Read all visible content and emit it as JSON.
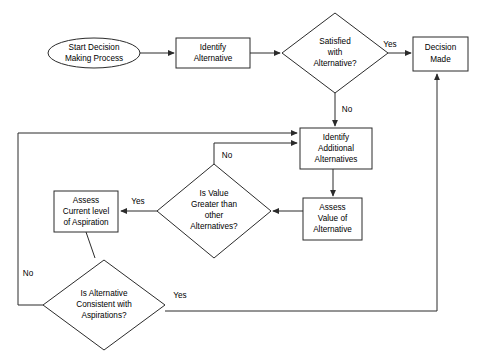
{
  "diagram": {
    "type": "flowchart",
    "background_color": "#ffffff",
    "line_color": "#2b2b2b",
    "text_color": "#000000",
    "nodes": [
      {
        "id": "start",
        "shape": "ellipse",
        "lines": [
          "Start Decision",
          "Making Process"
        ],
        "line1": "Start Decision",
        "line2": "Making Process",
        "cx": 94,
        "cy": 53,
        "rx": 46,
        "ry": 15
      },
      {
        "id": "identify-alternative",
        "shape": "rectangle",
        "lines": [
          "Identify",
          "Alternative"
        ],
        "line1": "Identify",
        "line2": "Alternative",
        "x": 176,
        "y": 38,
        "w": 74,
        "h": 30
      },
      {
        "id": "satisfied-with-alternative",
        "shape": "diamond",
        "lines": [
          "Satisfied",
          "with",
          "Alternative?"
        ],
        "line1": "Satisfied",
        "line2": "with",
        "line3": "Alternative?",
        "cx": 335,
        "cy": 53,
        "rx": 53,
        "ry": 40
      },
      {
        "id": "decision-made",
        "shape": "rectangle",
        "lines": [
          "Decision",
          "Made"
        ],
        "line1": "Decision",
        "line2": "Made",
        "x": 413,
        "y": 37,
        "w": 55,
        "h": 34
      },
      {
        "id": "identify-additional-alternatives",
        "shape": "rectangle",
        "lines": [
          "Identify",
          "Additional",
          "Alternatives"
        ],
        "line1": "Identify",
        "line2": "Additional",
        "line3": "Alternatives",
        "x": 300,
        "y": 128,
        "w": 72,
        "h": 41
      },
      {
        "id": "assess-value-of-alternative",
        "shape": "rectangle",
        "lines": [
          "Assess",
          "Value of",
          "Alternative"
        ],
        "line1": "Assess",
        "line2": "Value of",
        "line3": "Alternative",
        "x": 303,
        "y": 198,
        "w": 59,
        "h": 42
      },
      {
        "id": "is-value-greater",
        "shape": "diamond",
        "lines": [
          "Is Value",
          "Greater than",
          "other",
          "Alternatives?"
        ],
        "line1": "Is Value",
        "line2": "Greater than",
        "line3": "other",
        "line4": "Alternatives?",
        "cx": 214,
        "cy": 211,
        "rx": 57,
        "ry": 47
      },
      {
        "id": "assess-current-level-of-aspiration",
        "shape": "rectangle",
        "lines": [
          "Assess",
          "Current level",
          "of Aspiration"
        ],
        "line1": "Assess",
        "line2": "Current level",
        "line3": "of Aspiration",
        "x": 54,
        "y": 191,
        "w": 64,
        "h": 41
      },
      {
        "id": "is-alternative-consistent",
        "shape": "diamond",
        "lines": [
          "Is Alternative",
          "Consistent with",
          "Aspirations?"
        ],
        "line1": "Is Alternative",
        "line2": "Consistent with",
        "line3": "Aspirations?",
        "cx": 104,
        "cy": 305,
        "rx": 61,
        "ry": 45
      }
    ],
    "edge_labels": [
      {
        "id": "yes-satisfied",
        "text": "Yes",
        "x": 390,
        "y": 45
      },
      {
        "id": "no-satisfied",
        "text": "No",
        "x": 347,
        "y": 110
      },
      {
        "id": "no-is-value-greater",
        "text": "No",
        "x": 227,
        "y": 156
      },
      {
        "id": "yes-is-value-greater",
        "text": "Yes",
        "x": 138,
        "y": 202
      },
      {
        "id": "no-is-alternative-consistent",
        "text": "No",
        "x": 28,
        "y": 274
      },
      {
        "id": "yes-is-alternative-consistent",
        "text": "Yes",
        "x": 180,
        "y": 296
      }
    ],
    "edges": [
      {
        "id": "start-to-identify",
        "from": "start",
        "to": "identify-alternative",
        "label": ""
      },
      {
        "id": "identify-to-satisfied",
        "from": "identify-alternative",
        "to": "satisfied-with-alternative",
        "label": ""
      },
      {
        "id": "satisfied-yes-to-decision",
        "from": "satisfied-with-alternative",
        "to": "decision-made",
        "label": "Yes"
      },
      {
        "id": "satisfied-no-to-additional",
        "from": "satisfied-with-alternative",
        "to": "identify-additional-alternatives",
        "label": "No"
      },
      {
        "id": "additional-to-assess-value",
        "from": "identify-additional-alternatives",
        "to": "assess-value-of-alternative",
        "label": ""
      },
      {
        "id": "assess-value-to-is-value-greater",
        "from": "assess-value-of-alternative",
        "to": "is-value-greater",
        "label": ""
      },
      {
        "id": "is-value-greater-no-to-additional",
        "from": "is-value-greater",
        "to": "identify-additional-alternatives",
        "label": "No"
      },
      {
        "id": "is-value-greater-yes-to-aspiration",
        "from": "is-value-greater",
        "to": "assess-current-level-of-aspiration",
        "label": "Yes"
      },
      {
        "id": "aspiration-to-is-consistent",
        "from": "assess-current-level-of-aspiration",
        "to": "is-alternative-consistent",
        "label": ""
      },
      {
        "id": "is-consistent-no-to-additional",
        "from": "is-alternative-consistent",
        "to": "identify-additional-alternatives",
        "label": "No"
      },
      {
        "id": "is-consistent-yes-to-decision",
        "from": "is-alternative-consistent",
        "to": "decision-made",
        "label": "Yes"
      }
    ]
  }
}
